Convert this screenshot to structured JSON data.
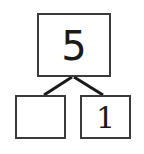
{
  "number_bond": {
    "whole": {
      "value": "5"
    },
    "parts": [
      {
        "value": ""
      },
      {
        "value": "1"
      }
    ]
  },
  "colors": {
    "line": "#1a1a1a",
    "border": "#3a3a3a",
    "background": "#ffffff"
  }
}
